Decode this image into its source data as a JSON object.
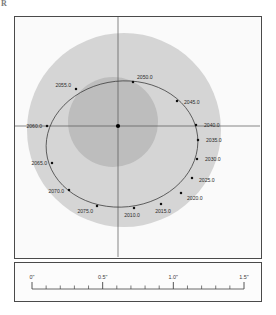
{
  "figure": {
    "corner_mark": "R",
    "background_color": "#fafafa",
    "frame_color": "#4a4a4a"
  },
  "chart_data": {
    "type": "scatter",
    "title": "",
    "xlabel": "",
    "ylabel": "",
    "grid": false,
    "legend": null,
    "axis_units": "arcsec",
    "center_marker": {
      "x": 0.0,
      "y": 0.0,
      "label": "primary-star"
    },
    "axes": {
      "horizontal_axis": true,
      "vertical_axis": true,
      "x_range_arcsec": [
        -0.72,
        0.85
      ],
      "y_range_arcsec": [
        -0.78,
        0.72
      ]
    },
    "orbit": {
      "shape": "ellipse",
      "semi_major_axis_px": 76,
      "semi_minor_axis_px": 63,
      "center_offset_px": {
        "x": 4,
        "y": 18
      },
      "rotation_deg": -6
    },
    "regions": [
      {
        "name": "outer-halo",
        "color": "#d5d5d5",
        "shape": "circle",
        "cx_px": 124,
        "cy_px": 130,
        "r_px": 97
      },
      {
        "name": "inner-core",
        "color": "#bdbdbd",
        "shape": "circle",
        "cx_px": 113,
        "cy_px": 122,
        "r_px": 45
      }
    ],
    "points": [
      {
        "label": "2010.0",
        "x_px": 134,
        "y_px": 208,
        "label_dx": -2,
        "label_dy": 9,
        "anchor": "middle"
      },
      {
        "label": "2015.0",
        "x_px": 161,
        "y_px": 204,
        "label_dx": 2,
        "label_dy": 9,
        "anchor": "middle"
      },
      {
        "label": "2020.0",
        "x_px": 181,
        "y_px": 193,
        "label_dx": 6,
        "label_dy": 7,
        "anchor": "start"
      },
      {
        "label": "2025.0",
        "x_px": 192,
        "y_px": 178,
        "label_dx": 7,
        "label_dy": 4,
        "anchor": "start"
      },
      {
        "label": "2030.0",
        "x_px": 197,
        "y_px": 159,
        "label_dx": 8,
        "label_dy": 2,
        "anchor": "start"
      },
      {
        "label": "2035.0",
        "x_px": 198,
        "y_px": 140,
        "label_dx": 8,
        "label_dy": 2,
        "anchor": "start"
      },
      {
        "label": "2040.0",
        "x_px": 196,
        "y_px": 125,
        "label_dx": 8,
        "label_dy": 2,
        "anchor": "start"
      },
      {
        "label": "2045.0",
        "x_px": 177,
        "y_px": 101,
        "label_dx": 7,
        "label_dy": 3,
        "anchor": "start"
      },
      {
        "label": "2050.0",
        "x_px": 133,
        "y_px": 82,
        "label_dx": 4,
        "label_dy": -3,
        "anchor": "start"
      },
      {
        "label": "2055.0",
        "x_px": 76,
        "y_px": 89,
        "label_dx": -5,
        "label_dy": -2,
        "anchor": "end"
      },
      {
        "label": "2060.0",
        "x_px": 47,
        "y_px": 126,
        "label_dx": -5,
        "label_dy": 2,
        "anchor": "end"
      },
      {
        "label": "2065.0",
        "x_px": 52,
        "y_px": 163,
        "label_dx": -5,
        "label_dy": 2,
        "anchor": "end"
      },
      {
        "label": "2070.0",
        "x_px": 69,
        "y_px": 190,
        "label_dx": -5,
        "label_dy": 3,
        "anchor": "end"
      },
      {
        "label": "2075.0",
        "x_px": 97,
        "y_px": 206,
        "label_dx": -4,
        "label_dy": 7,
        "anchor": "end"
      }
    ]
  },
  "scale_bar": {
    "ticks": [
      {
        "value": "0\"",
        "x_px": 31,
        "major": true
      },
      {
        "value": "",
        "x_px": 50,
        "major": false
      },
      {
        "value": "",
        "x_px": 69,
        "major": false
      },
      {
        "value": "",
        "x_px": 88,
        "major": false
      },
      {
        "value": "",
        "x_px": 107,
        "major": false
      },
      {
        "value": "0.5\"",
        "x_px": 126,
        "major": true
      },
      {
        "value": "",
        "x_px": 145,
        "major": false
      },
      {
        "value": "",
        "x_px": 164,
        "major": false
      },
      {
        "value": "",
        "x_px": 183,
        "major": false
      },
      {
        "value": "",
        "x_px": 202,
        "major": false
      },
      {
        "value": "1.0\"",
        "x_px": 221,
        "major": true
      },
      {
        "value": "",
        "x_px": 240,
        "major": false
      },
      {
        "value": "",
        "x_px": 259,
        "major": false
      },
      {
        "value": "",
        "x_px": 278,
        "major": false
      },
      {
        "value": "",
        "x_px": 297,
        "major": false
      },
      {
        "value": "1.5\"",
        "x_px": 316,
        "major": true
      }
    ],
    "labels": [
      "0\"",
      "0.5\"",
      "1.0\"",
      "1.5\""
    ]
  }
}
